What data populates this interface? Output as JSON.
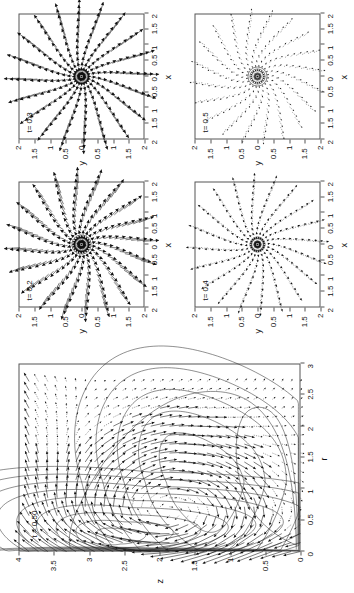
{
  "figure": {
    "orientation_deg": -90,
    "background": "#ffffff",
    "ink": "#111111"
  },
  "chart_data": [
    {
      "id": "main-meridional-plot",
      "type": "line",
      "title": "t = 0.50",
      "xlabel": "r",
      "ylabel": "z",
      "xlim": [
        0,
        3
      ],
      "ylim": [
        0,
        4
      ],
      "xticks": [
        0,
        0.5,
        1,
        1.5,
        2,
        2.5,
        3
      ],
      "xticklabels": [
        "0",
        "0.5",
        "1",
        "1.5",
        "2",
        "2.5",
        "3"
      ],
      "yticks": [
        0,
        0.5,
        1,
        1.5,
        2,
        2.5,
        3,
        3.5,
        4
      ],
      "yticklabels": [
        "0",
        "0.5",
        "1",
        "1.5",
        "2",
        "2.5",
        "3",
        "3.5",
        "4"
      ],
      "grid": false,
      "legend": "none",
      "description": "Meridional (r,z) plane: streamline/vorticity contours overlaid with a velocity vector field. A large recirculating plume fills 0<r<2.2, 0<z<3.3 with a strong near-axis jet along r<0.8 and a broad outer return cell.",
      "contours": {
        "count": 18,
        "style": "solid thin"
      },
      "vectors": {
        "grid_nx": 22,
        "grid_ny": 30,
        "style": "arrows, length proportional to speed"
      }
    },
    {
      "id": "panel-t02",
      "type": "scatter",
      "title": "t= 0.2",
      "xlabel": "x",
      "ylabel": "y",
      "xlim": [
        -2,
        2
      ],
      "ylim": [
        -2,
        2
      ],
      "xticks": [
        -2,
        -1.5,
        -1,
        -0.5,
        0,
        0.5,
        1,
        1.5,
        2
      ],
      "xticklabels": [
        "2",
        "1.5",
        "1",
        "0.5",
        "0",
        "0.5",
        "1",
        "1.5",
        "2"
      ],
      "yticks": [
        -2,
        -1.5,
        -1,
        -0.5,
        0,
        0.5,
        1,
        1.5,
        2
      ],
      "yticklabels": [
        "2",
        "1.5",
        "1",
        "0.5",
        "0",
        "0.5",
        "1",
        "1.5",
        "2"
      ],
      "grid": false,
      "legend": "none",
      "description": "Horizontal-plane velocity vectors: strong radial outflow on 20 spokes, thick heavy arrows, with a tight spiral core at the origin.",
      "n_spokes": 20,
      "core_rings": 5,
      "vector_weight": "heavy"
    },
    {
      "id": "panel-t03",
      "type": "scatter",
      "title": "t= 0.3",
      "xlabel": "x",
      "ylabel": "y",
      "xlim": [
        -2,
        2
      ],
      "ylim": [
        -2,
        2
      ],
      "xticks": [
        -2,
        -1.5,
        -1,
        -0.5,
        0,
        0.5,
        1,
        1.5,
        2
      ],
      "xticklabels": [
        "2",
        "1.5",
        "1",
        "0.5",
        "0",
        "0.5",
        "1",
        "1.5",
        "2"
      ],
      "yticks": [
        -2,
        -1.5,
        -1,
        -0.5,
        0,
        0.5,
        1,
        1.5,
        2
      ],
      "yticklabels": [
        "2",
        "1.5",
        "1",
        "0.5",
        "0",
        "0.5",
        "1",
        "1.5",
        "2"
      ],
      "grid": false,
      "legend": "none",
      "description": "Horizontal-plane velocity vectors: near-radial spokes, slightly less swirl than t=0.2, tight dense core.",
      "n_spokes": 20,
      "core_rings": 4,
      "vector_weight": "heavy"
    },
    {
      "id": "panel-t04",
      "type": "scatter",
      "title": "t= 0.4",
      "xlabel": "x",
      "ylabel": "y",
      "xlim": [
        -2,
        2
      ],
      "ylim": [
        -2,
        2
      ],
      "xticks": [
        -2,
        -1.5,
        -1,
        -0.5,
        0,
        0.5,
        1,
        1.5,
        2
      ],
      "xticklabels": [
        "2",
        "1.5",
        "1",
        "0.5",
        "0",
        "0.5",
        "1",
        "1.5",
        "2"
      ],
      "yticks": [
        -2,
        -1.5,
        -1,
        -0.5,
        0,
        0.5,
        1,
        1.5,
        2
      ],
      "yticklabels": [
        "2",
        "1.5",
        "1",
        "0.5",
        "0",
        "0.5",
        "1",
        "1.5",
        "2"
      ],
      "grid": false,
      "legend": "none",
      "description": "Horizontal-plane velocity vectors: weaker, thinner spokes with small arrowheads; compact swirling core.",
      "n_spokes": 20,
      "core_rings": 4,
      "vector_weight": "light"
    },
    {
      "id": "panel-t05",
      "type": "scatter",
      "title": "t= 0.5",
      "xlabel": "x",
      "ylabel": "y",
      "xlim": [
        -2,
        2
      ],
      "ylim": [
        -2,
        2
      ],
      "xticks": [
        -2,
        -1.5,
        -1,
        -0.5,
        0,
        0.5,
        1,
        1.5,
        2
      ],
      "xticklabels": [
        "2",
        "1.5",
        "1",
        "0.5",
        "0",
        "0.5",
        "1",
        "1.5",
        "2"
      ],
      "yticks": [
        -2,
        -1.5,
        -1,
        -0.5,
        0,
        0.5,
        1,
        1.5,
        2
      ],
      "yticklabels": [
        "2",
        "1.5",
        "1",
        "0.5",
        "0",
        "0.5",
        "1",
        "1.5",
        "2"
      ],
      "grid": false,
      "legend": "none",
      "description": "Horizontal-plane velocity vectors: faint dotted radial spokes with a pronounced spiral (swirl-dominated) core.",
      "n_spokes": 20,
      "core_rings": 5,
      "vector_weight": "faint"
    }
  ],
  "main": {
    "key": "t = 0.50",
    "xlabel": "r",
    "ylabel": "z",
    "xticklabels": [
      "0",
      "0.5",
      "1",
      "1.5",
      "2",
      "2.5",
      "3"
    ],
    "yticklabels": [
      "0",
      "0.5",
      "1",
      "1.5",
      "2",
      "2.5",
      "3",
      "3.5",
      "4"
    ]
  },
  "grid_panels": {
    "xlabel": "x",
    "ylabel": "y",
    "ticklabels": [
      "2",
      "1.5",
      "1",
      "0.5",
      "0",
      "0.5",
      "1",
      "1.5",
      "2"
    ],
    "keys": [
      "t= 0.2",
      "t= 0.3",
      "t= 0.4",
      "t= 0.5"
    ]
  }
}
